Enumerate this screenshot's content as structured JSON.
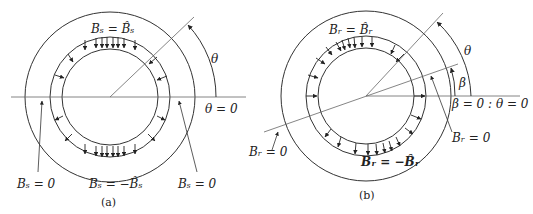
{
  "figure_a": {
    "caption": "(a)",
    "top_label": "Bₛ = B̂ₛ",
    "bottom_label": "Bₛ = −B̂ₛ",
    "left_zero_label": "Bₛ = 0",
    "right_zero_label": "Bₛ = 0",
    "angle_label": "θ",
    "reference_label": "θ = 0"
  },
  "figure_b": {
    "caption": "(b)",
    "top_label": "Bᵣ = B̂ᵣ",
    "bottom_label": "Bᵣ = −B̂ᵣ",
    "left_zero_label": "Bᵣ = 0",
    "right_zero_label": "Bᵣ = 0",
    "angle_theta_label": "θ",
    "angle_beta_label": "β",
    "reference_label": "β = 0 : θ = 0"
  },
  "colors": {
    "line": "#333333",
    "thin_line": "#555555",
    "background": "#ffffff"
  }
}
